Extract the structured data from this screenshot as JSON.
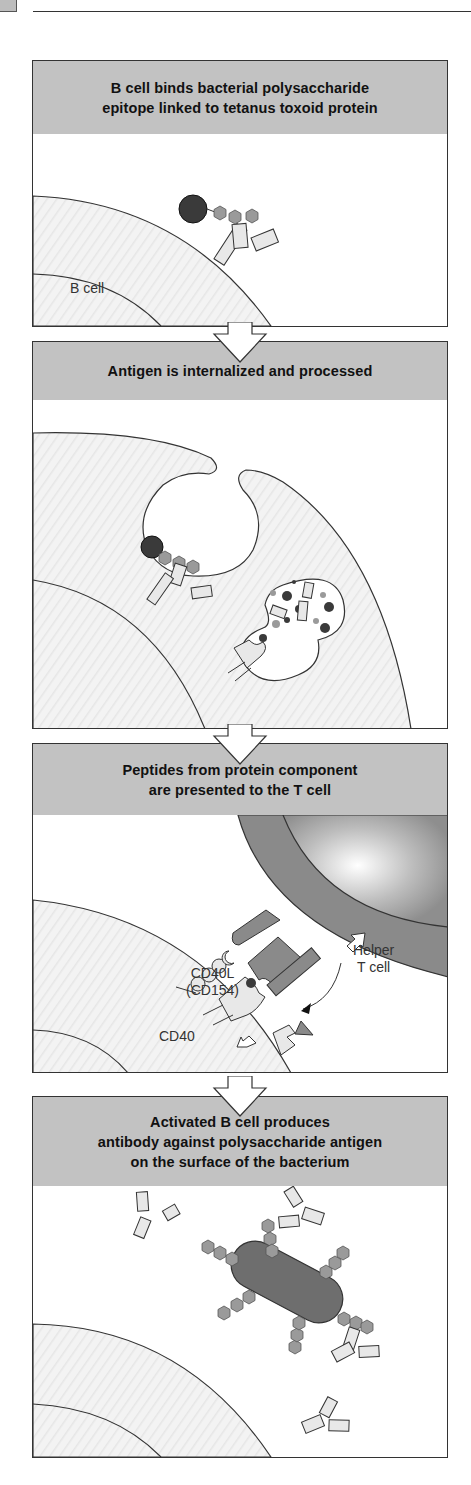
{
  "page": {
    "header_rule": true
  },
  "panels": [
    {
      "id": "step-1",
      "title_lines": [
        "B cell binds bacterial polysaccharide",
        "epitope linked to tetanus toxoid protein"
      ],
      "labels": {
        "b_cell": "B cell"
      }
    },
    {
      "id": "step-2",
      "title_lines": [
        "Antigen is internalized and processed"
      ],
      "labels": {}
    },
    {
      "id": "step-3",
      "title_lines": [
        "Peptides from protein component",
        "are presented to the T cell"
      ],
      "labels": {
        "helper_t_cell_line1": "Helper",
        "helper_t_cell_line2": "T cell",
        "cd40l_line1": "CD40L",
        "cd40l_line2": "(CD154)",
        "cd40": "CD40",
        "cytokines": "cytokines"
      }
    },
    {
      "id": "step-4",
      "title_lines": [
        "Activated B cell produces",
        "antibody against polysaccharide antigen",
        "on the surface of the bacterium"
      ],
      "labels": {}
    }
  ],
  "colors": {
    "header_fill": "#c2c2c2",
    "cell_fill": "#f1f1f1",
    "protein_dark": "#3a3a3a",
    "hexagon_fill": "#9a9a9a",
    "antibody_fill": "#e6e6e6",
    "t_cell_membrane": "#8a8a8a",
    "bacterium": "#6e6e6e"
  }
}
